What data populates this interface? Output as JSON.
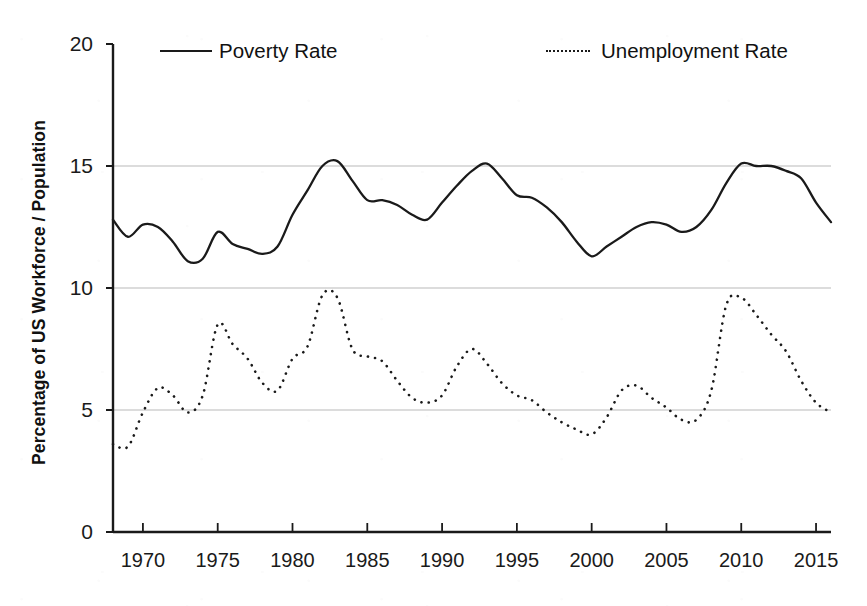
{
  "figure": {
    "background_color": "#ffffff",
    "ink_color": "#1a1a1a",
    "gridline_color": "#b9b9b9"
  },
  "axes": {
    "y_title": "Percentage of US Workforce / Population",
    "y_ticks": [
      "0",
      "5",
      "10",
      "15",
      "20"
    ],
    "y_tick_values": [
      0,
      5,
      10,
      15,
      20
    ],
    "y_min": 0,
    "y_max": 20,
    "x_ticks": [
      "1970",
      "1975",
      "1980",
      "1985",
      "1990",
      "1995",
      "2000",
      "2005",
      "2010",
      "2015"
    ],
    "x_tick_values": [
      1970,
      1975,
      1980,
      1985,
      1990,
      1995,
      2000,
      2005,
      2010,
      2015
    ],
    "x_min": 1968,
    "x_max": 2016,
    "x_title": ""
  },
  "legend": {
    "position": "top",
    "items": [
      {
        "label": "Poverty Rate",
        "style": "solid",
        "color": "#1a1a1a"
      },
      {
        "label": "Unemployment Rate",
        "style": "dotted",
        "color": "#1a1a1a"
      }
    ]
  },
  "chart_data": {
    "type": "line",
    "title": "",
    "subtitle": "",
    "xlabel": "",
    "ylabel": "Percentage of US Workforce / Population",
    "xlim": [
      1968,
      2016
    ],
    "ylim": [
      0,
      20
    ],
    "grid": "horizontal-only",
    "legend_position": "top",
    "x": [
      1968,
      1969,
      1970,
      1971,
      1972,
      1973,
      1974,
      1975,
      1976,
      1977,
      1978,
      1979,
      1980,
      1981,
      1982,
      1983,
      1984,
      1985,
      1986,
      1987,
      1988,
      1989,
      1990,
      1991,
      1992,
      1993,
      1994,
      1995,
      1996,
      1997,
      1998,
      1999,
      2000,
      2001,
      2002,
      2003,
      2004,
      2005,
      2006,
      2007,
      2008,
      2009,
      2010,
      2011,
      2012,
      2013,
      2014,
      2015,
      2016
    ],
    "series": [
      {
        "name": "Poverty Rate",
        "style": "solid",
        "color": "#1a1a1a",
        "values": [
          12.8,
          12.1,
          12.6,
          12.5,
          11.9,
          11.1,
          11.2,
          12.3,
          11.8,
          11.6,
          11.4,
          11.7,
          13.0,
          14.0,
          15.0,
          15.2,
          14.4,
          13.6,
          13.6,
          13.4,
          13.0,
          12.8,
          13.5,
          14.2,
          14.8,
          15.1,
          14.5,
          13.8,
          13.7,
          13.3,
          12.7,
          11.9,
          11.3,
          11.7,
          12.1,
          12.5,
          12.7,
          12.6,
          12.3,
          12.5,
          13.2,
          14.3,
          15.1,
          15.0,
          15.0,
          14.8,
          14.5,
          13.5,
          12.7
        ]
      },
      {
        "name": "Unemployment Rate",
        "style": "dotted",
        "color": "#1a1a1a",
        "values": [
          3.6,
          3.5,
          4.9,
          5.9,
          5.6,
          4.9,
          5.6,
          8.5,
          7.7,
          7.1,
          6.1,
          5.8,
          7.1,
          7.6,
          9.7,
          9.6,
          7.5,
          7.2,
          7.0,
          6.2,
          5.5,
          5.3,
          5.6,
          6.8,
          7.5,
          6.9,
          6.1,
          5.6,
          5.4,
          4.9,
          4.5,
          4.2,
          4.0,
          4.7,
          5.8,
          6.0,
          5.5,
          5.1,
          4.6,
          4.6,
          5.8,
          9.3,
          9.6,
          8.9,
          8.1,
          7.4,
          6.2,
          5.3,
          4.9
        ]
      }
    ]
  }
}
